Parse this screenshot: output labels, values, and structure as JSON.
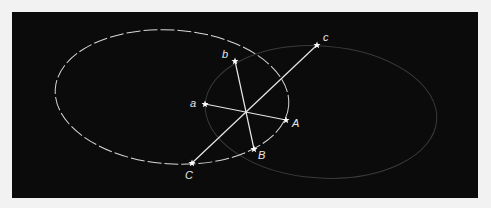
{
  "diagram": {
    "background": "#0b0b0b",
    "frame_color": "#f2f2f2",
    "line_color": "#e8e8e8",
    "ellipses": [
      {
        "name": "primary-ellipse",
        "cx": 172,
        "cy": 97,
        "rx": 117,
        "ry": 67,
        "rotate": 4,
        "style": "dashed",
        "color": "#d8d8d8"
      },
      {
        "name": "faint-ellipse",
        "cx": 321,
        "cy": 112,
        "rx": 116,
        "ry": 66,
        "rotate": 4,
        "style": "solid-faint",
        "color": "#3a3a3a"
      }
    ],
    "center": {
      "x": 246,
      "y": 112
    },
    "points": [
      {
        "id": "a",
        "label": "a",
        "x": 205,
        "y": 104,
        "lx": 190,
        "ly": 107
      },
      {
        "id": "b",
        "label": "b",
        "x": 235,
        "y": 61,
        "lx": 222,
        "ly": 58
      },
      {
        "id": "c",
        "label": "c",
        "x": 317,
        "y": 45,
        "lx": 323,
        "ly": 41
      },
      {
        "id": "A",
        "label": "A",
        "x": 286,
        "y": 120,
        "lx": 292,
        "ly": 127
      },
      {
        "id": "B",
        "label": "B",
        "x": 254,
        "y": 149,
        "lx": 259,
        "ly": 159
      },
      {
        "id": "C",
        "label": "C",
        "x": 192,
        "y": 163,
        "lx": 186,
        "ly": 179
      }
    ],
    "segments": [
      {
        "from": "a",
        "to": "A"
      },
      {
        "from": "b",
        "to": "B"
      },
      {
        "from": "c",
        "to": "C"
      }
    ]
  }
}
